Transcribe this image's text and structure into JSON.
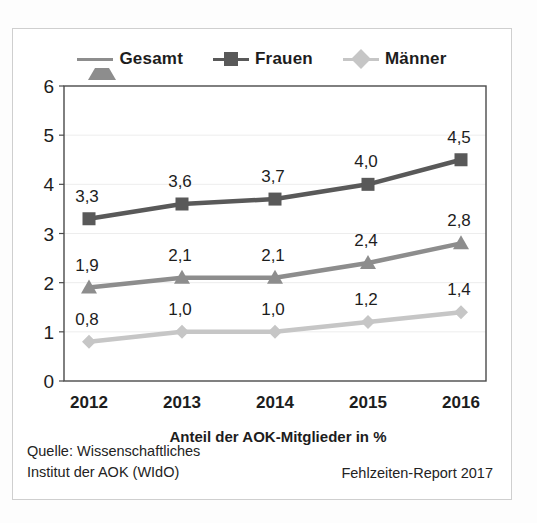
{
  "legend": {
    "items": [
      {
        "label": "Gesamt",
        "icon": "triangle-marker-icon",
        "color": "#8d8d8d"
      },
      {
        "label": "Frauen",
        "icon": "square-marker-icon",
        "color": "#595959"
      },
      {
        "label": "Männer",
        "icon": "diamond-marker-icon",
        "color": "#c6c6c6"
      }
    ]
  },
  "axes": {
    "y_ticks": [
      "0",
      "1",
      "2",
      "3",
      "4",
      "5",
      "6"
    ],
    "x_ticks": [
      "2012",
      "2013",
      "2014",
      "2015",
      "2016"
    ],
    "x_title": "Anteil der AOK-Mitglieder in %"
  },
  "footer": {
    "source": "Quelle: Wissenschaftliches\nInstitut der AOK (WIdO)",
    "report": "Fehlzeiten-Report 2017"
  },
  "chart_data": {
    "type": "line",
    "title": "",
    "subtitle": "",
    "xlabel": "Anteil der AOK-Mitglieder in %",
    "ylabel": "",
    "categories": [
      "2012",
      "2013",
      "2014",
      "2015",
      "2016"
    ],
    "ylim": [
      0,
      6
    ],
    "ytick_step": 1,
    "grid": true,
    "grid_axis": "y",
    "legend_position": "top-center",
    "value_labels": true,
    "decimal_separator": ",",
    "series": [
      {
        "name": "Frauen",
        "color": "#595959",
        "marker": "square",
        "values": [
          3.3,
          3.6,
          3.7,
          4.0,
          4.5
        ],
        "labels": [
          "3,3",
          "3,6",
          "3,7",
          "4,0",
          "4,5"
        ]
      },
      {
        "name": "Gesamt",
        "color": "#8d8d8d",
        "marker": "triangle",
        "values": [
          1.9,
          2.1,
          2.1,
          2.4,
          2.8
        ],
        "labels": [
          "1,9",
          "2,1",
          "2,1",
          "2,4",
          "2,8"
        ]
      },
      {
        "name": "Männer",
        "color": "#c6c6c6",
        "marker": "diamond",
        "values": [
          0.8,
          1.0,
          1.0,
          1.2,
          1.4
        ],
        "labels": [
          "0,8",
          "1,0",
          "1,0",
          "1,2",
          "1,4"
        ]
      }
    ]
  }
}
